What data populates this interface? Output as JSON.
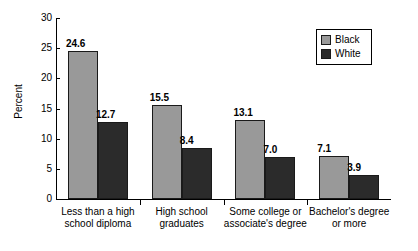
{
  "chart_data": {
    "type": "bar",
    "title": "",
    "xlabel": "",
    "ylabel": "Percent",
    "ylim": [
      0,
      30
    ],
    "yticks": [
      0,
      5,
      10,
      15,
      20,
      25,
      30
    ],
    "ytick_labels": [
      "0",
      "5",
      "10",
      "15",
      "20",
      "25",
      "30"
    ],
    "grid": false,
    "legend_position": "top-right",
    "categories": [
      "Less than a high\nschool diploma",
      "High school\ngraduates",
      "Some college or\nassociate's degree",
      "Bachelor's degree\nor more"
    ],
    "series": [
      {
        "name": "Black",
        "color": "#999999",
        "values": [
          24.6,
          15.5,
          13.1,
          7.1
        ],
        "value_labels": [
          "24.6",
          "15.5",
          "13.1",
          "7.1"
        ]
      },
      {
        "name": "White",
        "color": "#2b2b2b",
        "values": [
          12.7,
          8.4,
          7.0,
          3.9
        ],
        "value_labels": [
          "12.7",
          "8.4",
          "7.0",
          "3.9"
        ]
      }
    ]
  },
  "legend": {
    "entries": [
      {
        "label": "Black",
        "swatch": "legend-swatch-black"
      },
      {
        "label": "White",
        "swatch": "legend-swatch-white"
      }
    ]
  }
}
